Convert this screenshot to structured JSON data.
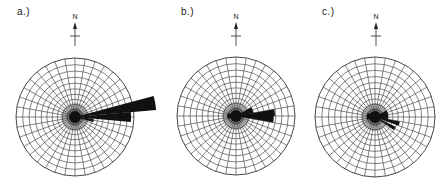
{
  "figure": {
    "panels": [
      {
        "id": "a",
        "label": "a.)",
        "north_label": "N",
        "cx": 75,
        "cy": 117,
        "r": 59,
        "label_x": 17,
        "label_y": 12,
        "arrow_x": 75
      },
      {
        "id": "b",
        "label": "b.)",
        "north_label": "N",
        "cx": 236,
        "cy": 116,
        "r": 59,
        "label_x": 181,
        "label_y": 12,
        "arrow_x": 236
      },
      {
        "id": "c",
        "label": "c.)",
        "north_label": "N",
        "cx": 375,
        "cy": 117,
        "r": 60,
        "label_x": 322,
        "label_y": 12,
        "arrow_x": 376
      }
    ],
    "colors": {
      "grid": "#333333",
      "petal": "#111111",
      "background": "#ffffff"
    }
  },
  "chart_data": [
    {
      "type": "rose",
      "title": "a.)",
      "orientation_reference": "N",
      "grid": {
        "rings": 10,
        "spoke_interval_deg": 10
      },
      "petals": [
        {
          "azimuth_from_deg": 75,
          "azimuth_to_deg": 85,
          "relative_length": 1.38
        },
        {
          "azimuth_from_deg": 85,
          "azimuth_to_deg": 95,
          "relative_length": 0.95
        },
        {
          "azimuth_from_deg": 95,
          "azimuth_to_deg": 105,
          "relative_length": 0.32
        }
      ]
    },
    {
      "type": "rose",
      "title": "b.)",
      "orientation_reference": "N",
      "grid": {
        "rings": 10,
        "spoke_interval_deg": 10
      },
      "petals": [
        {
          "azimuth_from_deg": 80,
          "azimuth_to_deg": 90,
          "relative_length": 0.66
        },
        {
          "azimuth_from_deg": 90,
          "azimuth_to_deg": 100,
          "relative_length": 0.64
        },
        {
          "azimuth_from_deg": 60,
          "azimuth_to_deg": 80,
          "relative_length": 0.3
        },
        {
          "azimuth_from_deg": 250,
          "azimuth_to_deg": 290,
          "relative_length": 0.15
        }
      ]
    },
    {
      "type": "rose",
      "title": "c.)",
      "orientation_reference": "N",
      "grid": {
        "rings": 10,
        "spoke_interval_deg": 10
      },
      "petals": [
        {
          "azimuth_from_deg": 100,
          "azimuth_to_deg": 110,
          "relative_length": 0.42
        },
        {
          "azimuth_from_deg": 115,
          "azimuth_to_deg": 125,
          "relative_length": 0.38
        },
        {
          "azimuth_from_deg": 60,
          "azimuth_to_deg": 100,
          "relative_length": 0.22
        },
        {
          "azimuth_from_deg": 250,
          "azimuth_to_deg": 300,
          "relative_length": 0.14
        }
      ]
    }
  ]
}
